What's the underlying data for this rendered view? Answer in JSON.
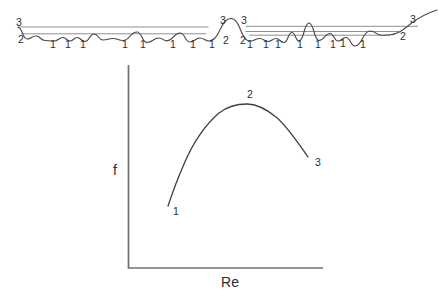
{
  "colors": {
    "background": "#ffffff",
    "label_text": "#2e2e2e",
    "wave_curve": "#4a4a4a",
    "guide_line": "#8f8f8f",
    "axis_line": "#707070",
    "plot_curve": "#3f3f3f"
  },
  "wave_diagram": {
    "level_labels": [
      {
        "text": "3",
        "x": 19,
        "y": 26
      },
      {
        "text": "2",
        "x": 21,
        "y": 43
      },
      {
        "text": "3",
        "x": 223,
        "y": 24
      },
      {
        "text": "2",
        "x": 226,
        "y": 43.5
      },
      {
        "text": "3",
        "x": 244,
        "y": 24
      },
      {
        "text": "2",
        "x": 243,
        "y": 43.5
      },
      {
        "text": "3",
        "x": 413,
        "y": 23
      },
      {
        "text": "2",
        "x": 403,
        "y": 40
      }
    ],
    "trough_labels": [
      {
        "text": "1",
        "x": 53,
        "y": 48
      },
      {
        "text": "1",
        "x": 68,
        "y": 48
      },
      {
        "text": "1",
        "x": 83,
        "y": 48
      },
      {
        "text": "1",
        "x": 125,
        "y": 48
      },
      {
        "text": "1",
        "x": 143,
        "y": 48
      },
      {
        "text": "1",
        "x": 173,
        "y": 48
      },
      {
        "text": "1",
        "x": 193,
        "y": 48
      },
      {
        "text": "1",
        "x": 212,
        "y": 48
      },
      {
        "text": "1",
        "x": 250,
        "y": 48
      },
      {
        "text": "1",
        "x": 266,
        "y": 48
      },
      {
        "text": "1",
        "x": 278,
        "y": 48
      },
      {
        "text": "1",
        "x": 300,
        "y": 48
      },
      {
        "text": "1",
        "x": 318,
        "y": 48
      },
      {
        "text": "1",
        "x": 333,
        "y": 48
      },
      {
        "text": "1",
        "x": 343,
        "y": 47
      },
      {
        "text": "1",
        "x": 363,
        "y": 48
      }
    ]
  },
  "plot": {
    "ylabel": "f",
    "xlabel": "Re",
    "point_labels": [
      {
        "text": "1",
        "x": 176,
        "y": 215
      },
      {
        "text": "2",
        "x": 250,
        "y": 98
      },
      {
        "text": "3",
        "x": 318,
        "y": 166
      }
    ]
  }
}
